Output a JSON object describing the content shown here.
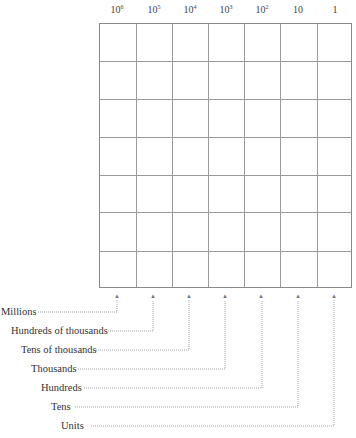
{
  "headers": [
    {
      "base": "10",
      "exp": "6"
    },
    {
      "base": "10",
      "exp": "5"
    },
    {
      "base": "10",
      "exp": "4"
    },
    {
      "base": "10",
      "exp": "3"
    },
    {
      "base": "10",
      "exp": "2"
    },
    {
      "base": "10",
      "exp": ""
    },
    {
      "base": "1",
      "exp": ""
    }
  ],
  "grid": {
    "columns": 7,
    "rows": 7
  },
  "arrow_glyph": "▴",
  "labels": [
    "Millions",
    "Hundreds of thousands",
    "Tens of thousands",
    "Thousands",
    "Hundreds",
    "Tens",
    "Units"
  ]
}
